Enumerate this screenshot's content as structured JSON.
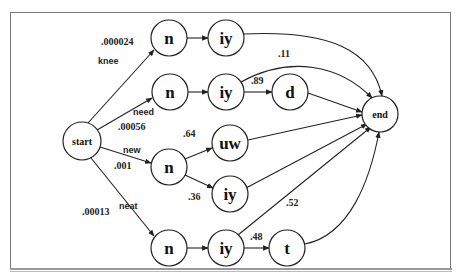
{
  "diagram": {
    "type": "pronunciation-network",
    "nodes": [
      {
        "id": "start",
        "label": "start",
        "cx": 82,
        "cy": 141,
        "r": 19,
        "size": "small"
      },
      {
        "id": "n_knee",
        "label": "n",
        "cx": 169,
        "cy": 38,
        "r": 18,
        "size": "large"
      },
      {
        "id": "iy_knee",
        "label": "iy",
        "cx": 226,
        "cy": 38,
        "r": 18,
        "size": "large"
      },
      {
        "id": "n_need",
        "label": "n",
        "cx": 170,
        "cy": 92,
        "r": 18,
        "size": "large"
      },
      {
        "id": "iy_need",
        "label": "iy",
        "cx": 226,
        "cy": 92,
        "r": 18,
        "size": "large"
      },
      {
        "id": "d_need",
        "label": "d",
        "cx": 290,
        "cy": 92,
        "r": 18,
        "size": "large"
      },
      {
        "id": "end",
        "label": "end",
        "cx": 380,
        "cy": 114,
        "r": 18,
        "size": "small"
      },
      {
        "id": "n_new",
        "label": "n",
        "cx": 169,
        "cy": 167,
        "r": 18,
        "size": "large"
      },
      {
        "id": "uw_new",
        "label": "uw",
        "cx": 230,
        "cy": 143,
        "r": 18,
        "size": "large"
      },
      {
        "id": "iy_new",
        "label": "iy",
        "cx": 230,
        "cy": 194,
        "r": 18,
        "size": "large"
      },
      {
        "id": "n_neat",
        "label": "n",
        "cx": 169,
        "cy": 248,
        "r": 18,
        "size": "large"
      },
      {
        "id": "iy_neat",
        "label": "iy",
        "cx": 226,
        "cy": 248,
        "r": 18,
        "size": "large"
      },
      {
        "id": "t_neat",
        "label": "t",
        "cx": 287,
        "cy": 248,
        "r": 18,
        "size": "large"
      }
    ],
    "word_labels": [
      {
        "text": "knee",
        "x": 98,
        "y": 64
      },
      {
        "text": "need",
        "x": 133,
        "y": 115
      },
      {
        "text": "new",
        "x": 123,
        "y": 153
      },
      {
        "text": "neat",
        "x": 119,
        "y": 209
      }
    ],
    "probabilities": [
      {
        "text": ".000024",
        "x": 101,
        "y": 45
      },
      {
        "text": ".00056",
        "x": 118,
        "y": 130
      },
      {
        "text": ".001",
        "x": 114,
        "y": 169
      },
      {
        "text": ".00013",
        "x": 82,
        "y": 215
      },
      {
        "text": ".11",
        "x": 278,
        "y": 57
      },
      {
        "text": ".89",
        "x": 251,
        "y": 84
      },
      {
        "text": ".64",
        "x": 183,
        "y": 137
      },
      {
        "text": ".36",
        "x": 188,
        "y": 200
      },
      {
        "text": ".52",
        "x": 286,
        "y": 206
      },
      {
        "text": ".48",
        "x": 250,
        "y": 240
      }
    ],
    "edges": [
      {
        "from": "start",
        "to": "n_knee",
        "path": "M88,123 L154,50"
      },
      {
        "from": "n_knee",
        "to": "iy_knee",
        "path": "M187,38 L208,38"
      },
      {
        "from": "iy_knee",
        "to": "end",
        "path": "M244,34 C330,30 372,50 382,96"
      },
      {
        "from": "start",
        "to": "n_need",
        "path": "M97,130 L152,98"
      },
      {
        "from": "n_need",
        "to": "iy_need",
        "path": "M188,92 L208,92"
      },
      {
        "from": "iy_need",
        "to": "d_need",
        "path": "M244,92 L272,92"
      },
      {
        "from": "iy_need",
        "to": "end",
        "path": "M241,82 C290,55 340,65 372,98"
      },
      {
        "from": "d_need",
        "to": "end",
        "path": "M308,93 L362,112"
      },
      {
        "from": "start",
        "to": "n_new",
        "path": "M100,147 L151,163"
      },
      {
        "from": "n_new",
        "to": "uw_new",
        "path": "M185,159 L212,148"
      },
      {
        "from": "n_new",
        "to": "iy_new",
        "path": "M185,175 L213,188"
      },
      {
        "from": "uw_new",
        "to": "end",
        "path": "M248,140 L362,115"
      },
      {
        "from": "start",
        "to": "n_neat",
        "path": "M91,158 L154,236"
      },
      {
        "from": "n_neat",
        "to": "iy_neat",
        "path": "M187,248 L208,248"
      },
      {
        "from": "iy_neat",
        "to": "t_neat",
        "path": "M244,248 L269,248"
      },
      {
        "from": "iy_new",
        "to": "end",
        "path": "M246,188 L367,124"
      },
      {
        "from": "iy_neat",
        "to": "end",
        "path": "M238,235 L371,127"
      },
      {
        "from": "t_neat",
        "to": "end",
        "path": "M305,244 C350,235 370,180 379,132"
      }
    ]
  }
}
